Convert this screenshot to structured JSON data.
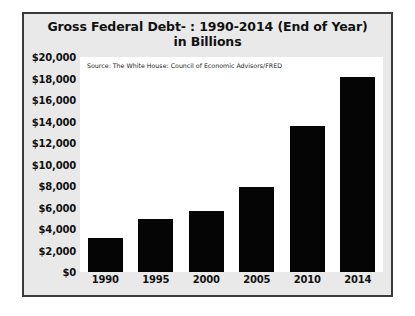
{
  "chart_data": {
    "type": "bar",
    "title": "Gross Federal Debt- : 1990-2014 (End of Year)",
    "subtitle": "in Billions",
    "source_note": "Source: The White House: Council of Economic Advisors/FRED",
    "categories": [
      "1990",
      "1995",
      "2000",
      "2005",
      "2010",
      "2014"
    ],
    "values": [
      3200,
      4900,
      5700,
      7900,
      13600,
      18100
    ],
    "series": [
      {
        "name": "Gross Federal Debt",
        "values": [
          3200,
          4900,
          5700,
          7900,
          13600,
          18100
        ]
      }
    ],
    "xlabel": "",
    "ylabel": "",
    "ylim": [
      0,
      20000
    ],
    "ytick_step": 2000,
    "ytick_labels": [
      "$20,000",
      "$18,000",
      "$16,000",
      "$14,000",
      "$12,000",
      "$10,000",
      "$8,000",
      "$6,000",
      "$4,000",
      "$2,000",
      "$0"
    ],
    "ytick_values": [
      20000,
      18000,
      16000,
      14000,
      12000,
      10000,
      8000,
      6000,
      4000,
      2000,
      0
    ],
    "grid": false,
    "legend": false,
    "bar_color": "#050505",
    "plot_background": "#ffffff",
    "frame_background": "#e9e9e9",
    "frame_border_color": "#3a3a3a"
  }
}
